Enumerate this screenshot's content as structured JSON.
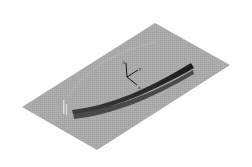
{
  "scene": {
    "background": "#ffffff",
    "plane": {
      "color": "#a9a9a9",
      "corners": [
        [
          22,
          107
        ],
        [
          155,
          23
        ],
        [
          230,
          65
        ],
        [
          97,
          150
        ]
      ]
    },
    "beam": {
      "color_dark": "#2e2e2e",
      "color_mid": "#555555"
    },
    "axes": {
      "labels": {
        "x": "x",
        "y": "y",
        "z": "z"
      }
    },
    "markers": {
      "left_post_color": "#e6e6e6"
    }
  }
}
